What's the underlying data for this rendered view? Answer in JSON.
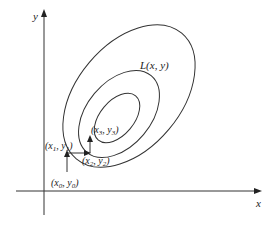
{
  "diagram": {
    "axes": {
      "x_label": "x",
      "y_label": "y"
    },
    "function_label": "L(x, y)",
    "contours": [
      {
        "name": "outer",
        "cx": 129,
        "cy": 96,
        "rx": 52,
        "ry": 80,
        "rotate": 40
      },
      {
        "name": "middle",
        "cx": 120,
        "cy": 113,
        "rx": 32,
        "ry": 48,
        "rotate": 40
      },
      {
        "name": "inner",
        "cx": 117,
        "cy": 118,
        "rx": 18,
        "ry": 28,
        "rotate": 40
      }
    ],
    "points": [
      {
        "label": "(x0, y0)",
        "display_x": "x",
        "sub_x": "0",
        "display_y": "y",
        "sub_y": "0"
      },
      {
        "label": "(x1, y1)",
        "display_x": "x",
        "sub_x": "1",
        "display_y": "y",
        "sub_y": "1"
      },
      {
        "label": "(x2, y2)",
        "display_x": "x",
        "sub_x": "2",
        "display_y": "y",
        "sub_y": "2"
      },
      {
        "label": "(x3, y3)",
        "display_x": "x",
        "sub_x": "3",
        "display_y": "y",
        "sub_y": "3"
      }
    ],
    "colors": {
      "stroke": "#333333",
      "text": "#222222"
    }
  }
}
